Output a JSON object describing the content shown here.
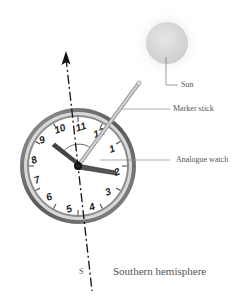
{
  "labels": {
    "sun": "Sun",
    "marker_stick": "Marker stick",
    "analogue_watch": "Analogue watch",
    "south": "S",
    "caption": "Southern hemisphere"
  },
  "watch": {
    "numerals": [
      "1",
      "2",
      "3",
      "4",
      "5",
      "6",
      "7",
      "8",
      "9",
      "10",
      "11",
      "12"
    ],
    "hour_hand_points_to": "2",
    "minute_hand_points_to": "9"
  },
  "colors": {
    "sun_fill": "#d9d9d9",
    "bezel": "#6e6e6e",
    "stick": "#b5b5b5",
    "text": "#555555",
    "line": "#111111"
  }
}
